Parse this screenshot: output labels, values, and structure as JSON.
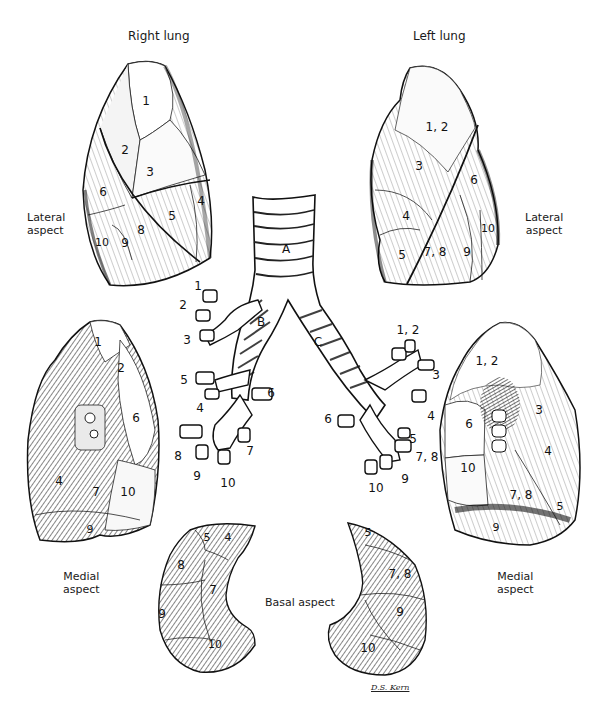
{
  "figure": {
    "titles": {
      "right_lung": "Right lung",
      "left_lung": "Left lung"
    },
    "aspect_labels": {
      "lateral_left_line1": "Lateral",
      "lateral_left_line2": "aspect",
      "lateral_right_line1": "Lateral",
      "lateral_right_line2": "aspect",
      "medial_left_line1": "Medial",
      "medial_left_line2": "aspect",
      "medial_right_line1": "Medial",
      "medial_right_line2": "aspect",
      "basal": "Basal aspect"
    },
    "right_lateral_segments": [
      "1",
      "2",
      "3",
      "4",
      "5",
      "6",
      "8",
      "9",
      "10"
    ],
    "left_lateral_segments": [
      "1, 2",
      "3",
      "4",
      "5",
      "6",
      "7, 8",
      "9",
      "10"
    ],
    "right_medial_segments": [
      "1",
      "2",
      "6",
      "4",
      "7",
      "10",
      "9"
    ],
    "left_medial_segments": [
      "1, 2",
      "3",
      "6",
      "4",
      "10",
      "7, 8",
      "5",
      "9"
    ],
    "bronchial_tree": {
      "trachea": "A",
      "right_main_bronchus": "B",
      "left_main_bronchus": "C",
      "right_branches": [
        "1",
        "2",
        "3",
        "5",
        "4",
        "6",
        "8",
        "7",
        "9",
        "10"
      ],
      "left_branches": [
        "1, 2",
        "3",
        "4",
        "6",
        "5",
        "7, 8",
        "9",
        "10"
      ]
    },
    "basal_right_segments": [
      "5",
      "4",
      "8",
      "7",
      "9",
      "10"
    ],
    "basal_left_segments": [
      "5",
      "7, 8",
      "9",
      "10"
    ],
    "signature": "D.S. Kern"
  }
}
